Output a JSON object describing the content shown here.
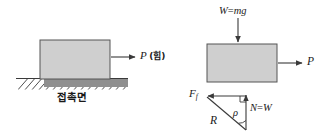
{
  "figure": {
    "background_color": "#ffffff",
    "stroke_color": "#3a3a3a",
    "block_fill": "#cfcfcf",
    "ground_fill": "#8a8a8a",
    "text_color": "#1a1a1a"
  },
  "left_panel": {
    "block_label": "",
    "applied_force": {
      "symbol": "P",
      "annotation": "(힘)",
      "full": "P (힘)",
      "direction": "right"
    },
    "surface_label": "접촉면",
    "surface_hatching": "diagonal"
  },
  "right_panel": {
    "weight": {
      "symbol": "W",
      "equals": "=",
      "expression": "mg",
      "full": "W=mg",
      "direction": "down"
    },
    "applied_force": {
      "symbol": "P",
      "full": "P",
      "direction": "right"
    },
    "force_triangle": {
      "friction": {
        "symbol": "F",
        "subscript": "f",
        "full": "F f",
        "direction": "left"
      },
      "normal": {
        "symbol": "N",
        "equals": "=",
        "value": "W",
        "full": "N=W",
        "direction": "up"
      },
      "resultant": {
        "symbol": "R",
        "full": "R"
      },
      "angle": {
        "symbol": "ρ",
        "full": "ρ",
        "meaning": "friction angle"
      }
    }
  }
}
